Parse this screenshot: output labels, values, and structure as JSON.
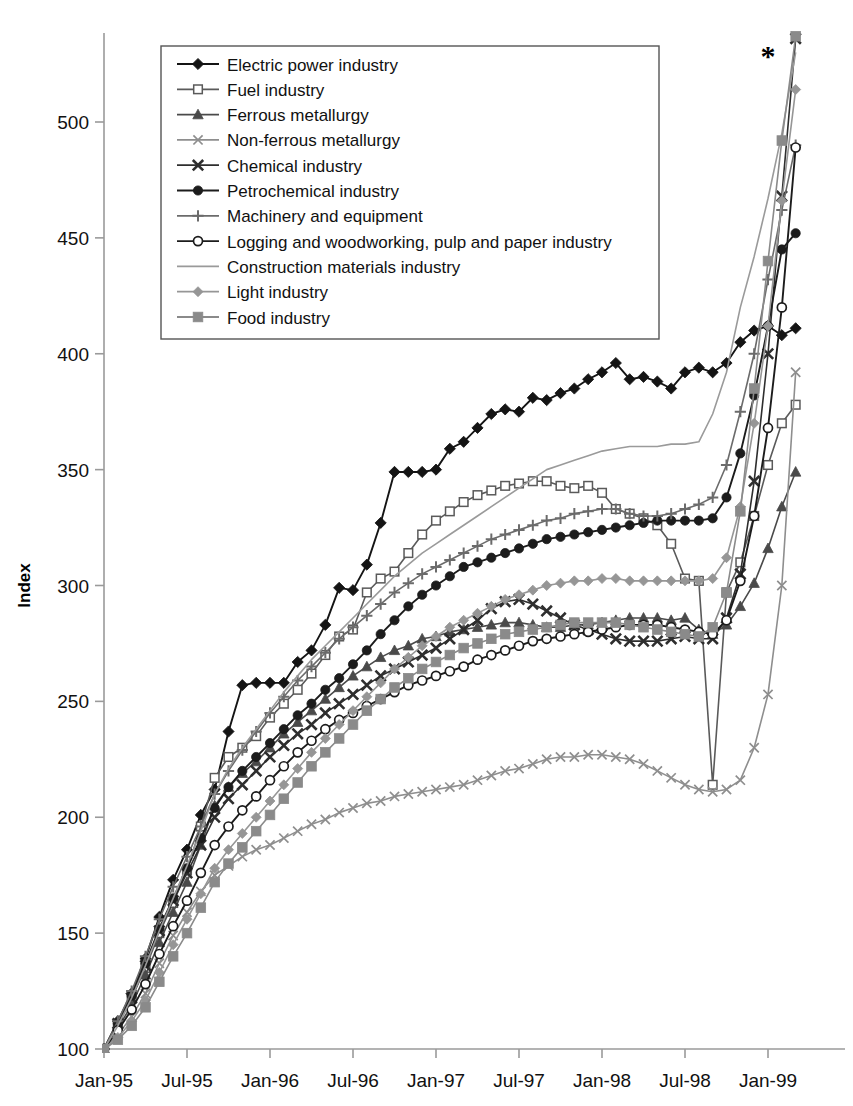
{
  "chart_data": {
    "type": "line",
    "title": "",
    "xlabel": "",
    "ylabel": "Index",
    "ylim": [
      100,
      540
    ],
    "yticks": [
      100,
      150,
      200,
      250,
      300,
      350,
      400,
      450,
      500
    ],
    "xticks": [
      "Jan-95",
      "Jul-95",
      "Jan-96",
      "Jul-96",
      "Jan-97",
      "Jul-97",
      "Jan-98",
      "Jul-98",
      "Jan-99"
    ],
    "grid": false,
    "legend_position": "top-left-inside",
    "annotations": [
      {
        "text": "*",
        "x_month": 48,
        "y": 524
      }
    ],
    "x_start": "Jan-95",
    "x_end": "Mar-99",
    "x_count": 51,
    "series": [
      {
        "name": "Electric power  industry",
        "marker": "filled-diamond",
        "color": "#141414",
        "values": [
          100,
          112,
          124,
          139,
          157,
          173,
          186,
          201,
          212,
          237,
          257,
          258,
          258,
          258,
          267,
          272,
          283,
          299,
          298,
          309,
          327,
          349,
          349,
          349,
          350,
          359,
          362,
          368,
          374,
          376,
          375,
          381,
          380,
          383,
          385,
          389,
          392,
          396,
          389,
          390,
          388,
          385,
          392,
          394,
          392,
          396,
          405,
          410,
          412,
          408,
          411
        ]
      },
      {
        "name": "Fuel industry",
        "marker": "open-square",
        "color": "#5a5a5a",
        "values": [
          100,
          110,
          122,
          135,
          150,
          163,
          177,
          196,
          217,
          226,
          230,
          235,
          243,
          249,
          255,
          262,
          270,
          278,
          281,
          297,
          303,
          306,
          314,
          322,
          328,
          332,
          336,
          339,
          341,
          343,
          344,
          345,
          345,
          343,
          342,
          343,
          340,
          333,
          331,
          329,
          326,
          318,
          303,
          302,
          214,
          297,
          310,
          330,
          352,
          370,
          378
        ]
      },
      {
        "name": "Ferrous metallurgy",
        "marker": "filled-triangle",
        "color": "#4a4a4a",
        "values": [
          100,
          109,
          119,
          132,
          146,
          159,
          172,
          188,
          205,
          213,
          219,
          224,
          230,
          236,
          241,
          246,
          251,
          256,
          261,
          265,
          269,
          272,
          274,
          277,
          278,
          280,
          281,
          282,
          283,
          284,
          284,
          283,
          282,
          282,
          283,
          283,
          284,
          285,
          286,
          286,
          286,
          285,
          286,
          281,
          279,
          283,
          291,
          301,
          316,
          334,
          349
        ]
      },
      {
        "name": "Non-ferrous metallurgy",
        "marker": "light-x",
        "color": "#8e8e8e",
        "values": [
          100,
          106,
          114,
          124,
          137,
          149,
          159,
          168,
          175,
          179,
          183,
          186,
          188,
          191,
          194,
          197,
          199,
          202,
          204,
          206,
          207,
          209,
          210,
          211,
          212,
          213,
          214,
          216,
          218,
          220,
          221,
          223,
          225,
          226,
          226,
          227,
          227,
          226,
          225,
          223,
          220,
          217,
          214,
          212,
          211,
          212,
          216,
          230,
          253,
          300,
          392
        ]
      },
      {
        "name": "Chemical industry",
        "marker": "bold-x",
        "color": "#2e2e2e",
        "values": [
          100,
          111,
          122,
          136,
          151,
          164,
          176,
          188,
          200,
          208,
          214,
          220,
          226,
          231,
          236,
          240,
          245,
          249,
          253,
          257,
          261,
          264,
          267,
          270,
          273,
          277,
          281,
          285,
          290,
          293,
          294,
          292,
          289,
          286,
          283,
          281,
          279,
          277,
          276,
          276,
          276,
          277,
          278,
          277,
          277,
          286,
          305,
          345,
          400,
          468,
          536
        ]
      },
      {
        "name": "Petrochemical industry",
        "marker": "small-filled-circle",
        "color": "#1c1c1c",
        "values": [
          100,
          111,
          123,
          137,
          152,
          165,
          178,
          191,
          204,
          213,
          220,
          226,
          232,
          238,
          244,
          249,
          255,
          260,
          266,
          272,
          279,
          285,
          291,
          296,
          300,
          304,
          308,
          310,
          312,
          314,
          316,
          318,
          320,
          321,
          322,
          323,
          324,
          325,
          326,
          327,
          328,
          328,
          328,
          328,
          329,
          338,
          357,
          382,
          412,
          445,
          452
        ]
      },
      {
        "name": "Machinery and equipment",
        "marker": "plus",
        "color": "#6b6b6b",
        "values": [
          100,
          112,
          125,
          140,
          156,
          170,
          183,
          196,
          210,
          220,
          229,
          237,
          245,
          252,
          259,
          265,
          271,
          277,
          282,
          287,
          292,
          297,
          301,
          305,
          308,
          311,
          314,
          317,
          320,
          322,
          324,
          326,
          328,
          329,
          331,
          332,
          333,
          333,
          331,
          330,
          330,
          331,
          333,
          335,
          338,
          352,
          375,
          400,
          432,
          462,
          490
        ]
      },
      {
        "name": "Logging and woodworking, pulp and paper industry",
        "marker": "open-circle",
        "color": "#1c1c1c",
        "values": [
          100,
          108,
          117,
          128,
          141,
          153,
          164,
          176,
          188,
          196,
          203,
          209,
          216,
          222,
          228,
          233,
          238,
          242,
          245,
          248,
          251,
          254,
          257,
          259,
          261,
          263,
          265,
          268,
          270,
          272,
          274,
          276,
          277,
          278,
          279,
          280,
          281,
          282,
          283,
          283,
          283,
          282,
          281,
          280,
          279,
          285,
          302,
          330,
          368,
          420,
          489
        ]
      },
      {
        "name": "Construction materials industry",
        "marker": "none",
        "color": "#9a9a9a",
        "values": [
          100,
          110,
          122,
          136,
          151,
          165,
          179,
          194,
          210,
          221,
          230,
          238,
          246,
          254,
          261,
          268,
          274,
          280,
          286,
          292,
          298,
          304,
          309,
          314,
          318,
          322,
          326,
          330,
          334,
          338,
          342,
          346,
          350,
          352,
          354,
          356,
          358,
          359,
          360,
          360,
          360,
          361,
          361,
          362,
          374,
          392,
          420,
          442,
          467,
          495,
          530
        ]
      },
      {
        "name": "Light industry",
        "marker": "gray-diamond",
        "color": "#969696",
        "values": [
          100,
          105,
          112,
          121,
          133,
          145,
          156,
          167,
          178,
          186,
          193,
          200,
          207,
          214,
          221,
          228,
          234,
          240,
          246,
          252,
          258,
          264,
          269,
          274,
          278,
          282,
          285,
          288,
          291,
          294,
          296,
          298,
          300,
          301,
          302,
          302,
          303,
          303,
          302,
          302,
          302,
          302,
          302,
          302,
          303,
          312,
          334,
          370,
          412,
          466,
          514
        ]
      },
      {
        "name": "Food industry",
        "marker": "gray-square",
        "color": "#8a8a8a",
        "values": [
          100,
          104,
          110,
          118,
          129,
          140,
          150,
          161,
          172,
          180,
          187,
          194,
          201,
          208,
          215,
          222,
          228,
          234,
          240,
          246,
          251,
          256,
          260,
          264,
          267,
          270,
          273,
          275,
          277,
          279,
          280,
          281,
          282,
          283,
          284,
          284,
          284,
          284,
          283,
          282,
          281,
          280,
          279,
          278,
          282,
          297,
          332,
          385,
          440,
          492,
          537
        ]
      }
    ]
  },
  "axes": {
    "y_label": "Index",
    "y_tick_labels": [
      "100",
      "150",
      "200",
      "250",
      "300",
      "350",
      "400",
      "450",
      "500"
    ],
    "x_tick_labels": [
      "Jan-95",
      "Jul-95",
      "Jan-96",
      "Jul-96",
      "Jan-97",
      "Jul-97",
      "Jan-98",
      "Jul-98",
      "Jan-99"
    ]
  },
  "legend": {
    "items": [
      {
        "label": "Electric power  industry",
        "marker": "filled-diamond",
        "color": "#141414"
      },
      {
        "label": "Fuel industry",
        "marker": "open-square",
        "color": "#5a5a5a"
      },
      {
        "label": "Ferrous metallurgy",
        "marker": "filled-triangle",
        "color": "#4a4a4a"
      },
      {
        "label": "Non-ferrous metallurgy",
        "marker": "light-x",
        "color": "#8e8e8e"
      },
      {
        "label": "Chemical industry",
        "marker": "bold-x",
        "color": "#2e2e2e"
      },
      {
        "label": "Petrochemical industry",
        "marker": "small-filled-circle",
        "color": "#1c1c1c"
      },
      {
        "label": "Machinery and equipment",
        "marker": "plus",
        "color": "#6b6b6b"
      },
      {
        "label": "Logging and woodworking, pulp and paper industry",
        "marker": "open-circle",
        "color": "#1c1c1c"
      },
      {
        "label": "Construction materials industry",
        "marker": "none",
        "color": "#9a9a9a"
      },
      {
        "label": "Light industry",
        "marker": "gray-diamond",
        "color": "#969696"
      },
      {
        "label": "Food industry",
        "marker": "gray-square",
        "color": "#8a8a8a"
      }
    ]
  },
  "annotation_star": "*"
}
